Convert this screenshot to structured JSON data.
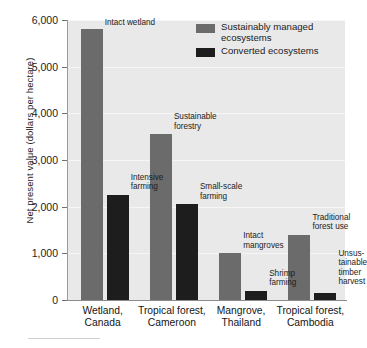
{
  "chart_data": {
    "type": "bar",
    "title": "",
    "xlabel": "",
    "ylabel": "Net present value (dollars per hectare)",
    "ylim": [
      0,
      6000
    ],
    "ytick_values": [
      0,
      1000,
      2000,
      3000,
      4000,
      5000,
      6000
    ],
    "ytick_labels": [
      "0",
      "1,000",
      "2,000",
      "3,000",
      "4,000",
      "5,000",
      "6,000"
    ],
    "grid": true,
    "legend_position": "top-right",
    "categories": [
      "Wetland,\nCanada",
      "Tropical forest,\nCameroon",
      "Mangrove,\nThailand",
      "Tropical forest,\nCambodia"
    ],
    "series": [
      {
        "name": "Sustainably managed ecosystems",
        "color": "#6b6b6b",
        "values": [
          5800,
          3550,
          1000,
          1400
        ],
        "point_labels": [
          "Intact wetland",
          "Sustainable\nforestry",
          "Intact\nmangroves",
          "Traditional\nforest use"
        ]
      },
      {
        "name": "Converted ecosystems",
        "color": "#1d1d1d",
        "values": [
          2250,
          2050,
          200,
          150
        ],
        "point_labels": [
          "Intensive\nfarming",
          "Small-scale\nfarming",
          "Shrimp\nfarming",
          "Unsus-\ntainable\ntimber\nharvest"
        ]
      }
    ]
  },
  "legend": {
    "items": [
      {
        "label": "Sustainably managed\necosystems",
        "color": "#6b6b6b"
      },
      {
        "label": "Converted ecosystems",
        "color": "#1d1d1d"
      }
    ]
  },
  "colors": {
    "plot_background": "#e9e9e9",
    "managed": "#6b6b6b",
    "converted": "#1d1d1d",
    "axis": "#8c8c8c",
    "text": "#1c1c1c"
  }
}
